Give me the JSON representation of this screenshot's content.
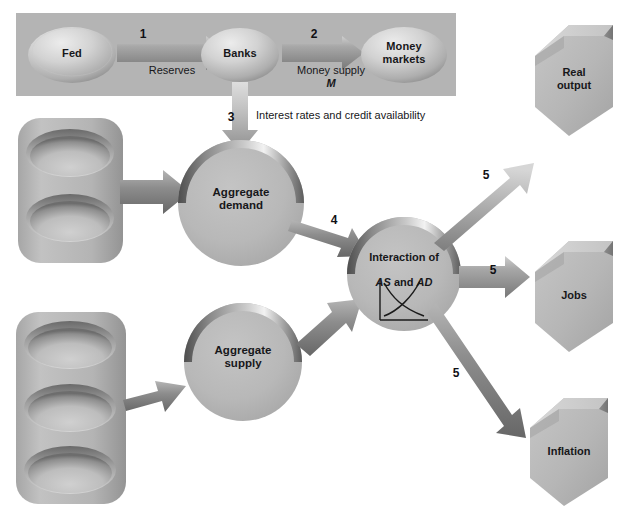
{
  "diagram": {
    "colors": {
      "panel_fill": "#b4b4b4",
      "shape_fill": "#b8b8b8",
      "shape_light": "#e2e2e2",
      "shape_dark": "#6f6f6f",
      "arrow_fill": "#9a9a9a",
      "text": "#17171a",
      "background": "#ffffff"
    },
    "panel": {
      "name": "monetary-policy-panel"
    },
    "top_nodes": [
      {
        "id": "fed",
        "label": "Fed"
      },
      {
        "id": "banks",
        "label": "Banks"
      },
      {
        "id": "money-markets",
        "label": "Money\nmarkets"
      }
    ],
    "circles": [
      {
        "id": "aggregate-demand",
        "label": "Aggregate\ndemand"
      },
      {
        "id": "aggregate-supply",
        "label": "Aggregate\nsupply"
      }
    ],
    "center_node": {
      "id": "interaction",
      "line1": "Interaction of",
      "as": "AS",
      "conjunction": " and ",
      "ad": "AD",
      "chart_caption": "AS and AD curves intersecting"
    },
    "outcomes": [
      {
        "id": "real-output",
        "label": "Real\noutput"
      },
      {
        "id": "jobs",
        "label": "Jobs"
      },
      {
        "id": "inflation",
        "label": "Inflation"
      }
    ],
    "arrow_labels": {
      "reserves": "Reserves",
      "money_supply": "Money supply",
      "money_supply_symbol": "M",
      "interest_rates": "Interest rates and credit availability"
    },
    "step_numbers": {
      "fed_to_banks": "1",
      "banks_to_money_markets": "2",
      "banks_to_aggregate_demand": "3",
      "demand_to_interaction": "4",
      "interaction_to_real_output": "5",
      "interaction_to_jobs": "5",
      "interaction_to_inflation": "5"
    },
    "stacks": [
      {
        "id": "demand-inputs-stack",
        "disc_count": 2,
        "labels": []
      },
      {
        "id": "supply-inputs-stack",
        "disc_count": 3,
        "labels": []
      }
    ]
  }
}
